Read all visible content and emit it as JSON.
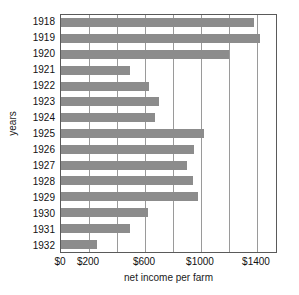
{
  "chart_data": {
    "type": "bar",
    "orientation": "horizontal",
    "title": "",
    "xlabel": "net income per farm",
    "ylabel": "years",
    "categories": [
      "1918",
      "1919",
      "1920",
      "1921",
      "1922",
      "1923",
      "1924",
      "1925",
      "1926",
      "1927",
      "1928",
      "1929",
      "1930",
      "1931",
      "1932"
    ],
    "values": [
      1380,
      1420,
      1200,
      490,
      630,
      700,
      670,
      1020,
      950,
      900,
      940,
      980,
      620,
      490,
      260
    ],
    "xlim": [
      0,
      1550
    ],
    "ylim_note": "category axis, 1918 at top",
    "xticks": [
      0,
      200,
      400,
      600,
      800,
      1000,
      1200,
      1400
    ],
    "xtick_labels_shown": [
      "$0",
      "",
      "$200",
      "",
      "$600",
      "",
      "$1000",
      "",
      "$1400"
    ],
    "grid": "vertical gridlines at every $200",
    "legend": "none",
    "bar_color": "#8c8c8c",
    "grid_color": "#9a9a9a",
    "axis_color": "#5a5a5a"
  },
  "axis": {
    "y_title": "years",
    "x_title": "net income per farm",
    "y_tick_labels": [
      "1918",
      "1919",
      "1920",
      "1921",
      "1922",
      "1923",
      "1924",
      "1925",
      "1926",
      "1927",
      "1928",
      "1929",
      "1930",
      "1931",
      "1932"
    ],
    "x_tick_labels": [
      {
        "label": "$0",
        "value": 0
      },
      {
        "label": "$200",
        "value": 200
      },
      {
        "label": "$600",
        "value": 600
      },
      {
        "label": "$1000",
        "value": 1000
      },
      {
        "label": "$1400",
        "value": 1400
      }
    ]
  }
}
